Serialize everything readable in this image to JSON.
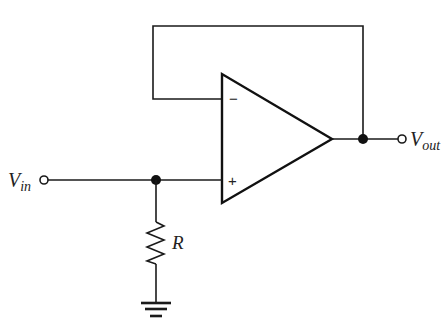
{
  "diagram": {
    "type": "circuit-schematic",
    "components": {
      "opamp": {
        "inverting_label": "−",
        "noninverting_label": "+",
        "fill": "#e6e6e6"
      },
      "resistor": {
        "label": "R"
      },
      "ground": {
        "label": ""
      }
    },
    "terminals": {
      "input": {
        "label_main": "V",
        "label_sub": "in"
      },
      "output": {
        "label_main": "V",
        "label_sub": "out"
      }
    },
    "connections": [
      "Vin → node A",
      "node A → op-amp non-inverting input (+)",
      "node A → R → ground",
      "op-amp output → node B",
      "node B → Vout",
      "node B → feedback loop → op-amp inverting input (−)"
    ]
  }
}
